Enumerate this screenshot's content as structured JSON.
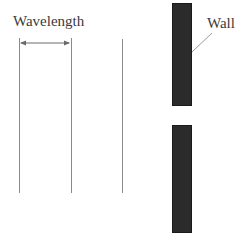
{
  "diagram": {
    "labels": {
      "wavelength": "Wavelength",
      "wall": "Wall"
    },
    "colors": {
      "wall": "#2b2b2b",
      "wavefront": "#8a8a8a",
      "text": "#3a3a3a",
      "background": "#ffffff"
    },
    "wavefronts": [
      {
        "x": 19,
        "top": 38,
        "bottom": 193
      },
      {
        "x": 71,
        "top": 38,
        "bottom": 193
      },
      {
        "x": 122,
        "top": 39,
        "bottom": 193
      }
    ],
    "wall_segments": [
      {
        "name": "upper",
        "x": 172,
        "top": 3,
        "bottom": 106
      },
      {
        "name": "lower",
        "x": 172,
        "top": 125,
        "bottom": 233
      }
    ],
    "gap": {
      "top": 106,
      "bottom": 125
    },
    "wavelength_arrow": {
      "from_x": 19,
      "to_x": 71,
      "y": 43
    }
  }
}
